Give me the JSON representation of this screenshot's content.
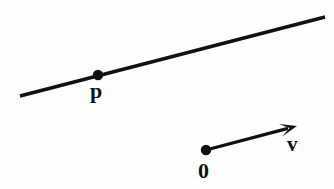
{
  "figure": {
    "background_color": "#fefefe",
    "stroke_color": "#111111",
    "width": 334,
    "height": 189,
    "labels": {
      "point_p": "p",
      "origin": "0",
      "vector_v": "v"
    },
    "elements": {
      "line": {
        "name": "infinite-line",
        "x1": 20,
        "y1": 96,
        "x2": 325,
        "y2": 17,
        "stroke_width": 3.4
      },
      "point_p": {
        "name": "point-p-dot",
        "cx": 98,
        "cy": 75,
        "r": 5.2
      },
      "origin_point": {
        "name": "origin-dot",
        "cx": 206,
        "cy": 150,
        "r": 5.2
      },
      "vector": {
        "name": "vector-v-arrow",
        "x1": 206,
        "y1": 150,
        "x2": 297,
        "y2": 126,
        "stroke_width": 3.2,
        "arrowhead_length": 17,
        "arrowhead_width": 13
      }
    }
  }
}
